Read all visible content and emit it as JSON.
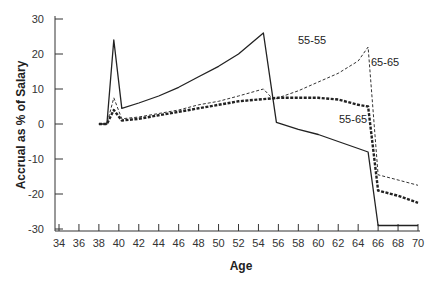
{
  "chart_data": {
    "type": "line",
    "title": "",
    "xlabel": "Age",
    "ylabel": "Accrual as % of Salary",
    "xlim": [
      34,
      70
    ],
    "ylim": [
      -30,
      30
    ],
    "x_ticks": [
      "34",
      "36",
      "38",
      "40",
      "42",
      "44",
      "46",
      "48",
      "50",
      "52",
      "54",
      "56",
      "58",
      "60",
      "62",
      "64",
      "66",
      "68",
      "70"
    ],
    "y_ticks": [
      "30",
      "20",
      "10",
      "0",
      "-10",
      "-20",
      "-30"
    ],
    "grid": false,
    "legend": "inline labels",
    "series": [
      {
        "name": "55-55",
        "style": "solid",
        "x": [
          38,
          38.8,
          39.5,
          40.3,
          42,
          44,
          46,
          48,
          50,
          52,
          54.5,
          55.8,
          58,
          60,
          62,
          64,
          65,
          66,
          68,
          70
        ],
        "y": [
          0,
          0,
          24,
          4.5,
          6,
          8,
          10.5,
          13.5,
          16.5,
          20,
          26,
          0.5,
          -1.5,
          -3,
          -5,
          -7,
          -8,
          -29,
          -29,
          -29
        ]
      },
      {
        "name": "65-65",
        "style": "dashed",
        "x": [
          38,
          38.8,
          39.5,
          40.3,
          42,
          44,
          46,
          48,
          50,
          52,
          54.5,
          55.5,
          58,
          60,
          62,
          64,
          65,
          66,
          68,
          70
        ],
        "y": [
          0,
          0,
          7.5,
          1.5,
          2,
          3,
          4,
          5.5,
          6.5,
          8,
          10,
          7,
          9.5,
          12,
          14.5,
          18,
          22,
          -14.5,
          -16,
          -17.5
        ]
      },
      {
        "name": "55-65",
        "style": "heavy-dashed",
        "x": [
          38,
          38.8,
          39.5,
          40.3,
          42,
          44,
          46,
          48,
          50,
          52,
          54,
          56,
          58,
          60,
          62,
          64,
          65,
          66,
          68,
          70
        ],
        "y": [
          0,
          0,
          4,
          1,
          1.5,
          2.5,
          3.5,
          4.5,
          5.5,
          6.5,
          7,
          7.5,
          7.5,
          7.5,
          7,
          5.5,
          5,
          -19,
          -20.5,
          -22.5
        ]
      }
    ],
    "annotations": [
      "55-55",
      "65-65",
      "55-65"
    ]
  },
  "labels": {
    "xlabel": "Age",
    "ylabel": "Accrual as % of Salary",
    "s1": "55-55",
    "s2": "65-65",
    "s3": "55-65"
  }
}
